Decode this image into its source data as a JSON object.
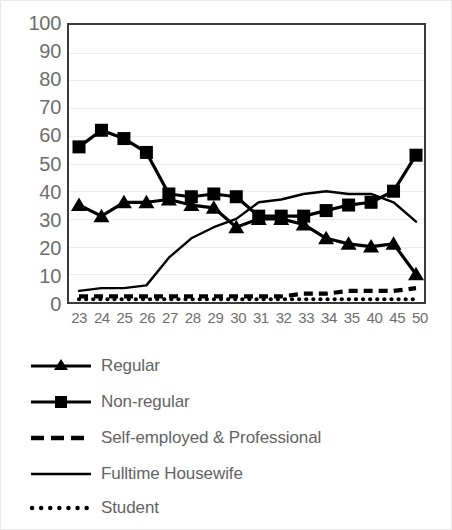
{
  "chart_data": {
    "type": "line",
    "title": "",
    "xlabel": "",
    "ylabel": "",
    "ylim": [
      0,
      100
    ],
    "ytick_step": 10,
    "grid": true,
    "legend_position": "bottom",
    "categories": [
      "23",
      "24",
      "25",
      "26",
      "27",
      "28",
      "29",
      "30",
      "31",
      "32",
      "33",
      "34",
      "35",
      "40",
      "45",
      "50"
    ],
    "yticks": [
      "100",
      "90",
      "80",
      "70",
      "60",
      "50",
      "40",
      "30",
      "20",
      "10",
      "0"
    ],
    "series": [
      {
        "name": "Regular",
        "marker": "triangle",
        "line_style": "solid",
        "color": "#000000",
        "values": [
          35,
          31,
          36,
          36,
          37,
          35,
          34,
          27,
          30,
          30,
          28,
          23,
          21,
          20,
          21,
          10
        ]
      },
      {
        "name": "Non-regular",
        "marker": "square",
        "line_style": "solid",
        "color": "#000000",
        "values": [
          56,
          62,
          59,
          54,
          39,
          38,
          39,
          38,
          31,
          31,
          31,
          33,
          35,
          36,
          40,
          53
        ]
      },
      {
        "name": "Self-employed & Professional",
        "marker": "none",
        "line_style": "dashed",
        "color": "#000000",
        "values": [
          2,
          2,
          2,
          2,
          2,
          2,
          2,
          2,
          2,
          2,
          3,
          3,
          4,
          4,
          4,
          5
        ]
      },
      {
        "name": "Fulltime Housewife",
        "marker": "none",
        "line_style": "thin-solid",
        "color": "#000000",
        "values": [
          4,
          5,
          5,
          6,
          16,
          23,
          27,
          30,
          36,
          37,
          39,
          40,
          39,
          39,
          36,
          29
        ]
      },
      {
        "name": "Student",
        "marker": "none",
        "line_style": "dotted",
        "color": "#000000",
        "values": [
          1,
          1,
          1,
          1,
          1,
          1,
          1,
          1,
          1,
          1,
          1,
          1,
          1,
          1,
          1,
          1
        ]
      }
    ]
  },
  "legend": {
    "items": [
      {
        "label": "Regular",
        "swatch": "line-with-triangle-marker"
      },
      {
        "label": "Non-regular",
        "swatch": "line-with-square-marker"
      },
      {
        "label": "Self-employed & Professional",
        "swatch": "dashed-line"
      },
      {
        "label": "Fulltime Housewife",
        "swatch": "solid-thin-line"
      },
      {
        "label": "Student",
        "swatch": "dotted-line"
      }
    ]
  }
}
